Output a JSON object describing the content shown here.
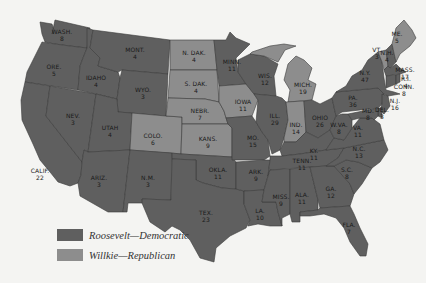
{
  "colors": {
    "roosevelt": "#5f5f5f",
    "willkie": "#8d8d8d",
    "background": "#f4f4f2"
  },
  "legend": {
    "items": [
      {
        "label": "Roosevelt—Democratic",
        "party": "roosevelt"
      },
      {
        "label": "Willkie—Republican",
        "party": "willkie"
      }
    ]
  },
  "states": [
    {
      "abbr": "WASH.",
      "votes": "8",
      "party": "roosevelt",
      "x": 62,
      "y": 34
    },
    {
      "abbr": "ORE.",
      "votes": "5",
      "party": "roosevelt",
      "x": 54,
      "y": 69
    },
    {
      "abbr": "CALIF.",
      "votes": "22",
      "party": "roosevelt",
      "x": 40,
      "y": 173
    },
    {
      "abbr": "NEV.",
      "votes": "3",
      "party": "roosevelt",
      "x": 73,
      "y": 118
    },
    {
      "abbr": "IDAHO",
      "votes": "4",
      "party": "roosevelt",
      "x": 96,
      "y": 80
    },
    {
      "abbr": "MONT.",
      "votes": "4",
      "party": "roosevelt",
      "x": 135,
      "y": 52
    },
    {
      "abbr": "WYO.",
      "votes": "3",
      "party": "roosevelt",
      "x": 143,
      "y": 92
    },
    {
      "abbr": "UTAH",
      "votes": "4",
      "party": "roosevelt",
      "x": 110,
      "y": 130
    },
    {
      "abbr": "COLO.",
      "votes": "6",
      "party": "willkie",
      "x": 153,
      "y": 138
    },
    {
      "abbr": "ARIZ.",
      "votes": "3",
      "party": "roosevelt",
      "x": 99,
      "y": 180
    },
    {
      "abbr": "N.M.",
      "votes": "3",
      "party": "roosevelt",
      "x": 148,
      "y": 180
    },
    {
      "abbr": "N. DAK.",
      "votes": "4",
      "party": "willkie",
      "x": 194,
      "y": 55
    },
    {
      "abbr": "S. DAK.",
      "votes": "4",
      "party": "willkie",
      "x": 196,
      "y": 86
    },
    {
      "abbr": "NEBR.",
      "votes": "7",
      "party": "willkie",
      "x": 200,
      "y": 113
    },
    {
      "abbr": "KANS.",
      "votes": "9",
      "party": "willkie",
      "x": 208,
      "y": 141
    },
    {
      "abbr": "OKLA.",
      "votes": "11",
      "party": "roosevelt",
      "x": 218,
      "y": 172
    },
    {
      "abbr": "TEX.",
      "votes": "23",
      "party": "roosevelt",
      "x": 206,
      "y": 215
    },
    {
      "abbr": "MINN.",
      "votes": "11",
      "party": "roosevelt",
      "x": 232,
      "y": 64
    },
    {
      "abbr": "IOWA",
      "votes": "11",
      "party": "willkie",
      "x": 243,
      "y": 104
    },
    {
      "abbr": "MO.",
      "votes": "15",
      "party": "roosevelt",
      "x": 253,
      "y": 140
    },
    {
      "abbr": "ARK.",
      "votes": "9",
      "party": "roosevelt",
      "x": 256,
      "y": 174
    },
    {
      "abbr": "LA.",
      "votes": "10",
      "party": "roosevelt",
      "x": 260,
      "y": 213
    },
    {
      "abbr": "WIS.",
      "votes": "12",
      "party": "roosevelt",
      "x": 265,
      "y": 78
    },
    {
      "abbr": "ILL.",
      "votes": "29",
      "party": "roosevelt",
      "x": 275,
      "y": 118
    },
    {
      "abbr": "MICH.",
      "votes": "19",
      "party": "willkie",
      "x": 303,
      "y": 87
    },
    {
      "abbr": "IND.",
      "votes": "14",
      "party": "willkie",
      "x": 296,
      "y": 127
    },
    {
      "abbr": "OHIO",
      "votes": "26",
      "party": "roosevelt",
      "x": 320,
      "y": 120
    },
    {
      "abbr": "KY.",
      "votes": "11",
      "party": "roosevelt",
      "x": 314,
      "y": 153
    },
    {
      "abbr": "TENN.",
      "votes": "11",
      "party": "roosevelt",
      "x": 302,
      "y": 163
    },
    {
      "abbr": "MISS.",
      "votes": "9",
      "party": "roosevelt",
      "x": 281,
      "y": 199
    },
    {
      "abbr": "ALA.",
      "votes": "11",
      "party": "roosevelt",
      "x": 302,
      "y": 197
    },
    {
      "abbr": "GA.",
      "votes": "12",
      "party": "roosevelt",
      "x": 331,
      "y": 191
    },
    {
      "abbr": "FLA.",
      "votes": "7",
      "party": "roosevelt",
      "x": 349,
      "y": 227
    },
    {
      "abbr": "S.C.",
      "votes": "8",
      "party": "roosevelt",
      "x": 347,
      "y": 172
    },
    {
      "abbr": "N.C.",
      "votes": "13",
      "party": "roosevelt",
      "x": 359,
      "y": 151
    },
    {
      "abbr": "VA.",
      "votes": "11",
      "party": "roosevelt",
      "x": 358,
      "y": 130
    },
    {
      "abbr": "W.VA.",
      "votes": "8",
      "party": "roosevelt",
      "x": 339,
      "y": 127
    },
    {
      "abbr": "PA.",
      "votes": "36",
      "party": "roosevelt",
      "x": 353,
      "y": 100
    },
    {
      "abbr": "N.Y.",
      "votes": "47",
      "party": "roosevelt",
      "x": 365,
      "y": 75
    },
    {
      "abbr": "VT.",
      "votes": "3",
      "party": "willkie",
      "x": 377,
      "y": 52
    },
    {
      "abbr": "N.H.",
      "votes": "4",
      "party": "roosevelt",
      "x": 387,
      "y": 55
    },
    {
      "abbr": "ME.",
      "votes": "5",
      "party": "willkie",
      "x": 397,
      "y": 36
    },
    {
      "abbr": "MASS.",
      "votes": "17",
      "party": "roosevelt",
      "x": 405,
      "y": 72
    },
    {
      "abbr": "R.I.",
      "votes": "4",
      "party": "roosevelt",
      "x": 406,
      "y": 81
    },
    {
      "abbr": "CONN.",
      "votes": "8",
      "party": "roosevelt",
      "x": 404,
      "y": 89
    },
    {
      "abbr": "N.J.",
      "votes": "16",
      "party": "roosevelt",
      "x": 395,
      "y": 103
    },
    {
      "abbr": "DEL.",
      "votes": "3",
      "party": "roosevelt",
      "x": 382,
      "y": 112
    },
    {
      "abbr": "MD.",
      "votes": "8",
      "party": "roosevelt",
      "x": 368,
      "y": 113
    }
  ]
}
